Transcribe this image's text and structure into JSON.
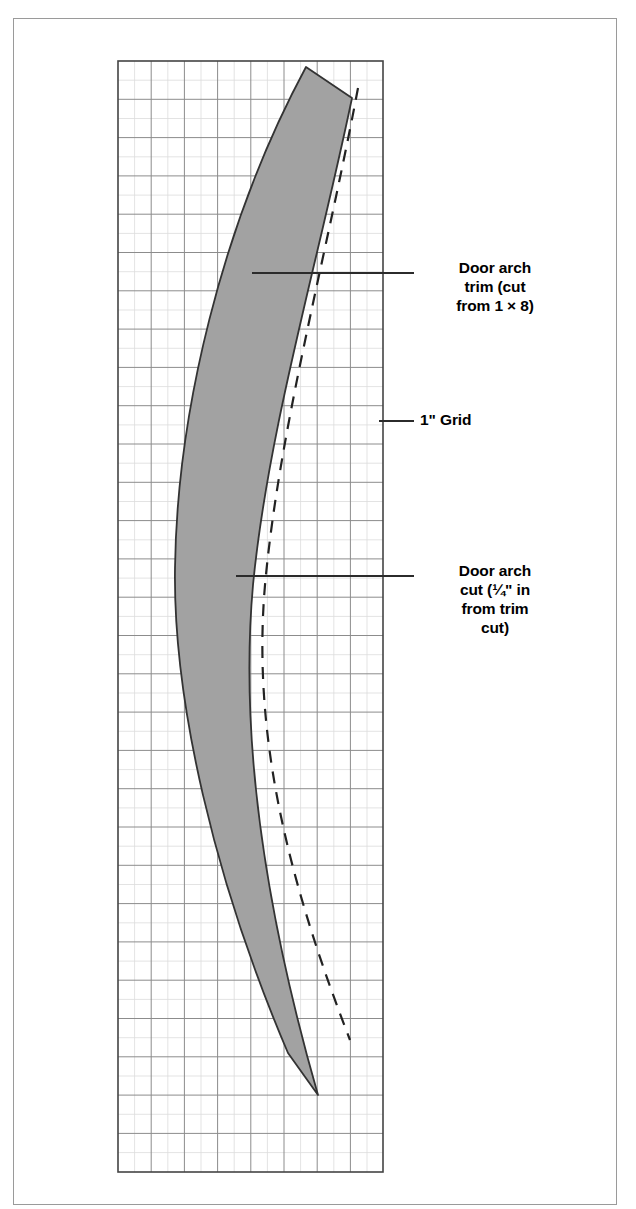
{
  "figure": {
    "kind": "woodworking-cut-layout-diagram"
  },
  "grid": {
    "label": "1\" Grid",
    "major_cols": 8,
    "major_rows": 29,
    "minor_per_major": 2,
    "box": {
      "x": 118,
      "y": 61,
      "width": 265,
      "height": 1111
    },
    "major_line_color": "#8c8c8c",
    "minor_line_color": "#d8d8d8",
    "border_color": "#444444"
  },
  "shapes": {
    "arch_band": {
      "name": "door arch trim band",
      "fill": "#a2a2a2",
      "stroke": "#333333",
      "stroke_width": 1.8
    },
    "arch_cut_line": {
      "name": "door arch cut line",
      "style": "dashed",
      "stroke": "#222222",
      "stroke_width": 2.2,
      "dash": "12 9"
    }
  },
  "callouts": [
    {
      "id": "trim",
      "lines": [
        "Door arch",
        "trim (cut",
        "from 1 × 8)"
      ],
      "leader": {
        "x1": 252,
        "y1": 273,
        "x2": 414,
        "y2": 273
      }
    },
    {
      "id": "grid",
      "lines": [
        "1\" Grid"
      ],
      "leader": {
        "x1": 379,
        "y1": 421,
        "x2": 414,
        "y2": 421
      }
    },
    {
      "id": "cut",
      "lines": [
        "Door arch",
        "cut (¼\" in",
        "from trim",
        "cut)"
      ],
      "leader": {
        "x1": 236,
        "y1": 576,
        "x2": 414,
        "y2": 576
      }
    }
  ],
  "colors": {
    "page_background": "#ffffff",
    "frame_border": "#9a9a9a",
    "text": "#000000",
    "leader_line": "#2b2b2b"
  }
}
